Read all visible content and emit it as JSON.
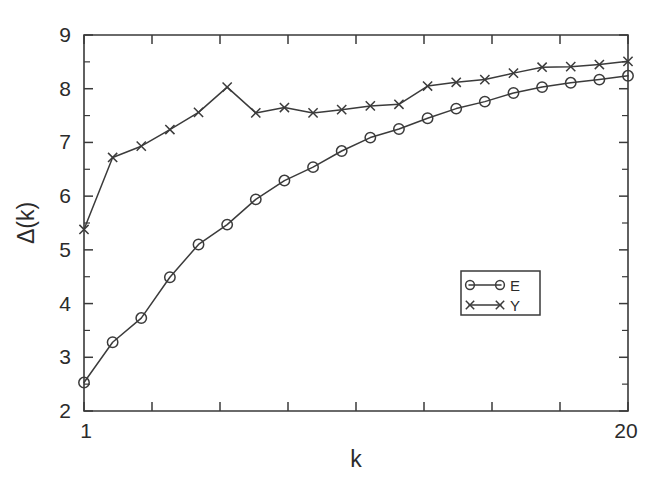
{
  "chart_data": {
    "type": "line",
    "title": "",
    "xlabel": "k",
    "ylabel": "Δ(k)",
    "xlim": [
      1,
      20
    ],
    "ylim": [
      2,
      9
    ],
    "grid": false,
    "x": [
      1,
      2,
      3,
      4,
      5,
      6,
      7,
      8,
      9,
      10,
      11,
      12,
      13,
      14,
      15,
      16,
      17,
      18,
      19,
      20
    ],
    "xticks": [
      1,
      20
    ],
    "xtick_labels": [
      "1",
      "20"
    ],
    "yticks": [
      2,
      3,
      4,
      5,
      6,
      7,
      8,
      9
    ],
    "ytick_labels": [
      "2",
      "3",
      "4",
      "5",
      "6",
      "7",
      "8",
      "9"
    ],
    "yminor_ticks": [
      2.5,
      3.5,
      4.5,
      5.5,
      6.5,
      7.5,
      8.5
    ],
    "legend_position": "lower right",
    "series": [
      {
        "name": "E",
        "marker": "circle",
        "values": [
          2.53,
          3.28,
          3.73,
          4.49,
          5.1,
          5.47,
          5.94,
          6.29,
          6.54,
          6.84,
          7.09,
          7.25,
          7.45,
          7.63,
          7.76,
          7.92,
          8.03,
          8.11,
          8.17,
          8.24
        ]
      },
      {
        "name": "Y",
        "marker": "x",
        "values": [
          5.38,
          6.72,
          6.93,
          7.24,
          7.56,
          8.03,
          7.55,
          7.65,
          7.55,
          7.61,
          7.68,
          7.71,
          8.05,
          8.12,
          8.17,
          8.29,
          8.4,
          8.41,
          8.45,
          8.51
        ]
      }
    ]
  },
  "legend": {
    "entries": [
      {
        "label": "E",
        "marker": "circle"
      },
      {
        "label": "Y",
        "marker": "x"
      }
    ]
  }
}
